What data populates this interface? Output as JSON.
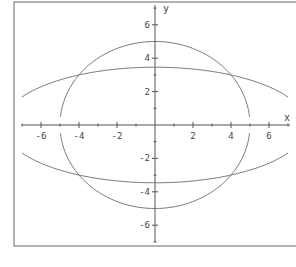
{
  "chart_data": {
    "type": "line",
    "title": "",
    "xlabel": "x",
    "ylabel": "y",
    "xlim": [
      -7,
      7
    ],
    "ylim": [
      -7,
      7
    ],
    "grid": false,
    "x_ticks": [
      -6,
      -4,
      -2,
      2,
      4,
      6
    ],
    "y_ticks": [
      6,
      4,
      2,
      -2,
      -4,
      -6
    ],
    "minor_ticks": "every 1 unit",
    "series": [
      {
        "name": "circle x^2 + y^2 = 25",
        "kind": "circle",
        "center": [
          0,
          0
        ],
        "radius": 5,
        "x_range": [
          -5,
          5
        ],
        "key_points": [
          [
            0,
            5
          ],
          [
            0,
            -5
          ],
          [
            -4,
            3
          ],
          [
            4,
            3
          ],
          [
            -4,
            -3
          ],
          [
            4,
            -3
          ],
          [
            -5,
            0.5
          ],
          [
            5,
            0.5
          ],
          [
            -5,
            -0.5
          ],
          [
            5,
            -0.5
          ]
        ]
      },
      {
        "name": "ellipse x^2/64 + y^2/12 = 1",
        "kind": "ellipse",
        "a": 8,
        "b": 3.46,
        "x_range": [
          -7,
          7
        ],
        "key_points": [
          [
            -7,
            1.68
          ],
          [
            -4,
            3
          ],
          [
            0,
            3.46
          ],
          [
            4,
            3
          ],
          [
            7,
            1.68
          ],
          [
            -7,
            -1.68
          ],
          [
            -4,
            -3
          ],
          [
            0,
            -3.46
          ],
          [
            4,
            -3
          ],
          [
            7,
            -1.68
          ]
        ]
      }
    ],
    "intersections": [
      [
        4,
        3
      ],
      [
        -4,
        3
      ],
      [
        4,
        -3
      ],
      [
        -4,
        -3
      ]
    ]
  },
  "colors": {
    "axis": "#555555",
    "curve": "#7a7a7a",
    "frame": "#666666",
    "background": "#ffffff"
  }
}
